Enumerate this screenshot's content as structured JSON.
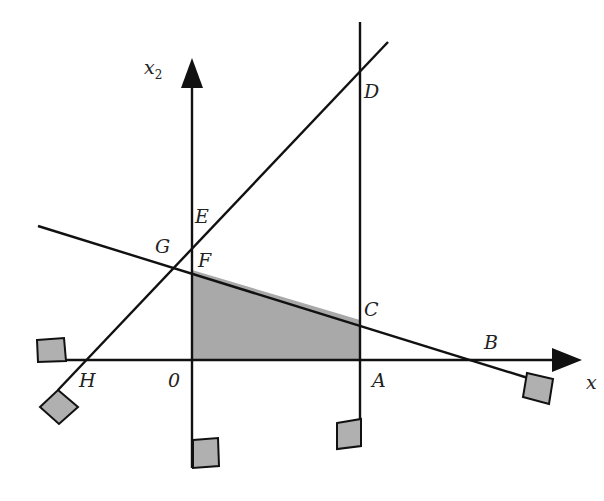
{
  "diagram": {
    "type": "linear-programming feasible region",
    "axes": {
      "x_axis_label": "x",
      "y_axis_label_base": "x",
      "y_axis_label_sub": "2"
    },
    "points": {
      "O": "0",
      "A": "A",
      "B": "B",
      "C": "C",
      "D": "D",
      "E": "E",
      "F": "F",
      "G": "G",
      "H": "H"
    },
    "shaded_region": [
      "O",
      "F",
      "C",
      "A"
    ],
    "colors": {
      "line": "#111111",
      "shade": "#a9a9a9",
      "marker_fill": "#b0b0b0",
      "label": "#222222"
    }
  }
}
